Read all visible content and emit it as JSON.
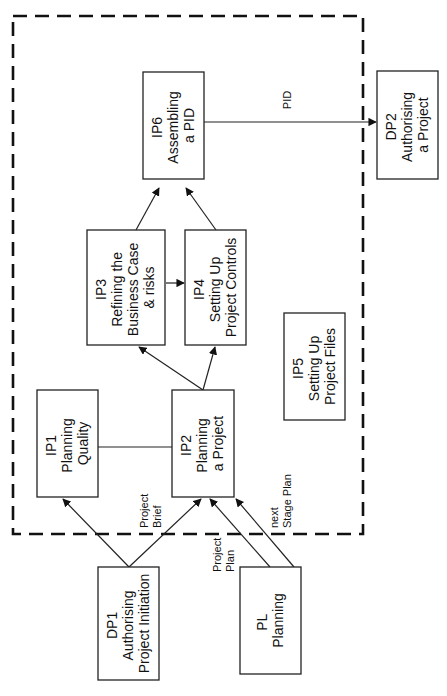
{
  "diagram": {
    "orientation": "rotated 90 degrees counter-clockwise",
    "boundary": {
      "label": "Initiating a Project (IP) process boundary",
      "style": "dashed"
    },
    "nodes": [
      {
        "id": "IP1",
        "code": "IP1",
        "lines": [
          "IP1",
          "Planning",
          "Quality"
        ]
      },
      {
        "id": "IP2",
        "code": "IP2",
        "lines": [
          "IP2",
          "Planning",
          "a Project"
        ]
      },
      {
        "id": "IP3",
        "code": "IP3",
        "lines": [
          "IP3",
          "Refining the",
          "Business Case",
          "& risks"
        ]
      },
      {
        "id": "IP4",
        "code": "IP4",
        "lines": [
          "IP4",
          "Setting Up",
          "Project Controls"
        ]
      },
      {
        "id": "IP5",
        "code": "IP5",
        "lines": [
          "IP5",
          "Setting Up",
          "Project Files"
        ]
      },
      {
        "id": "IP6",
        "code": "IP6",
        "lines": [
          "IP6",
          "Assembling",
          "a PID"
        ]
      },
      {
        "id": "DP1",
        "code": "DP1",
        "lines": [
          "DP1",
          "Authorising",
          "Project Initiation"
        ]
      },
      {
        "id": "DP2",
        "code": "DP2",
        "lines": [
          "DP2",
          "Authorising",
          "a Project"
        ]
      },
      {
        "id": "PL",
        "code": "PL",
        "lines": [
          "PL",
          "Planning"
        ]
      }
    ],
    "edges": [
      {
        "from": "DP1",
        "to": "IP1",
        "label": ""
      },
      {
        "from": "DP1",
        "to": "IP2",
        "label_lines": [
          "Project",
          "Brief"
        ]
      },
      {
        "from": "PL",
        "to": "IP2",
        "label_lines": [
          "Project",
          "Plan"
        ]
      },
      {
        "from": "PL",
        "to": "IP2",
        "label_lines": [
          "next",
          "Stage Plan"
        ]
      },
      {
        "from": "IP1",
        "to": "IP2",
        "label": "",
        "type": "line"
      },
      {
        "from": "IP2",
        "to": "IP3",
        "label": ""
      },
      {
        "from": "IP2",
        "to": "IP4",
        "label": ""
      },
      {
        "from": "IP3",
        "to": "IP4",
        "label": ""
      },
      {
        "from": "IP3",
        "to": "IP6",
        "label": ""
      },
      {
        "from": "IP4",
        "to": "IP6",
        "label": ""
      },
      {
        "from": "IP6",
        "to": "DP2",
        "label": "PID"
      }
    ]
  }
}
